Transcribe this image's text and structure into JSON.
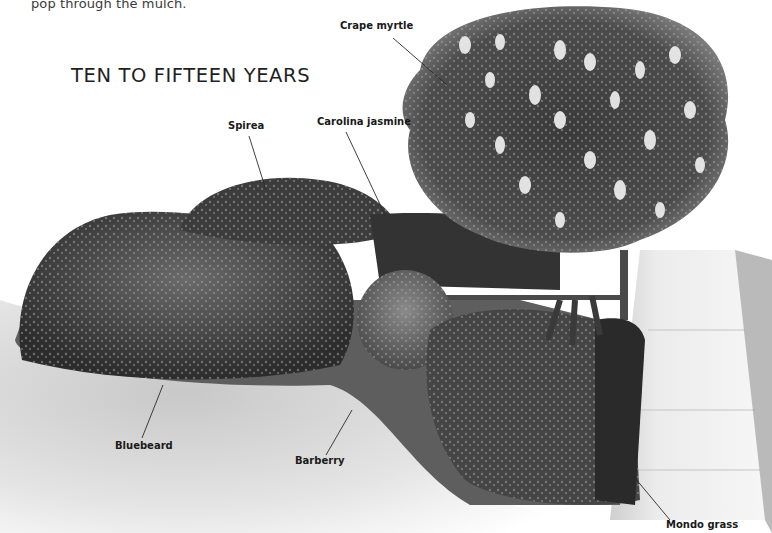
{
  "page": {
    "intro_text": "pop through the mulch.",
    "section_heading": "TEN TO FIFTEEN YEARS"
  },
  "illustration": {
    "description": "Grayscale garden bed illustration with flowering tree, shrubs, groundcover, lawn and sidewalk",
    "colors": {
      "background": "#ffffff",
      "foliage_dark": "#2e2e2e",
      "foliage_mid": "#5a5a5a",
      "foliage_light": "#8c8c8c",
      "lawn": "#d9d9d9",
      "sidewalk": "#eeeeee",
      "label_text": "#1a1a1a"
    }
  },
  "labels": [
    {
      "id": "crape-myrtle",
      "text": "Crape myrtle"
    },
    {
      "id": "spirea",
      "text": "Spirea"
    },
    {
      "id": "carolina-jasmine",
      "text": "Carolina jasmine"
    },
    {
      "id": "bluebeard",
      "text": "Bluebeard"
    },
    {
      "id": "barberry",
      "text": "Barberry"
    },
    {
      "id": "mondo-grass",
      "text": "Mondo grass"
    }
  ]
}
